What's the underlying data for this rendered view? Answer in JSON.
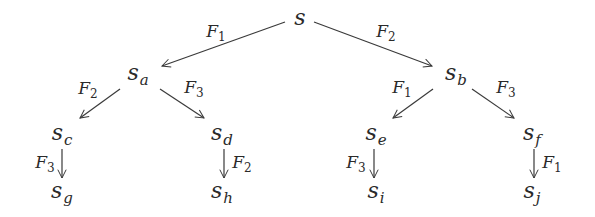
{
  "diagram": {
    "type": "tree",
    "nodes": [
      {
        "id": "s",
        "base": "s",
        "sub": "",
        "x": 300,
        "y": 18
      },
      {
        "id": "sa",
        "base": "s",
        "sub": "a",
        "x": 138,
        "y": 75
      },
      {
        "id": "sb",
        "base": "s",
        "sub": "b",
        "x": 456,
        "y": 75
      },
      {
        "id": "sc",
        "base": "s",
        "sub": "c",
        "x": 62,
        "y": 135
      },
      {
        "id": "sd",
        "base": "s",
        "sub": "d",
        "x": 222,
        "y": 135
      },
      {
        "id": "se",
        "base": "s",
        "sub": "e",
        "x": 376,
        "y": 135
      },
      {
        "id": "sf",
        "base": "s",
        "sub": "f",
        "x": 532,
        "y": 135
      },
      {
        "id": "sg",
        "base": "s",
        "sub": "g",
        "x": 62,
        "y": 193
      },
      {
        "id": "sh",
        "base": "s",
        "sub": "h",
        "x": 222,
        "y": 193
      },
      {
        "id": "si",
        "base": "s",
        "sub": "i",
        "x": 376,
        "y": 193
      },
      {
        "id": "sj",
        "base": "s",
        "sub": "j",
        "x": 532,
        "y": 193
      }
    ],
    "edges": [
      {
        "from": "s",
        "to": "sa",
        "label": "F",
        "label_sub": "1",
        "x1": 285,
        "y1": 22,
        "x2": 162,
        "y2": 66,
        "lx": 216,
        "ly": 33
      },
      {
        "from": "s",
        "to": "sb",
        "label": "F",
        "label_sub": "2",
        "x1": 314,
        "y1": 22,
        "x2": 432,
        "y2": 66,
        "lx": 386,
        "ly": 33
      },
      {
        "from": "sa",
        "to": "sc",
        "label": "F",
        "label_sub": "2",
        "x1": 120,
        "y1": 89,
        "x2": 80,
        "y2": 118,
        "lx": 88,
        "ly": 90
      },
      {
        "from": "sa",
        "to": "sd",
        "label": "F",
        "label_sub": "3",
        "x1": 160,
        "y1": 89,
        "x2": 204,
        "y2": 118,
        "lx": 194,
        "ly": 89
      },
      {
        "from": "sb",
        "to": "se",
        "label": "F",
        "label_sub": "1",
        "x1": 433,
        "y1": 89,
        "x2": 393,
        "y2": 118,
        "lx": 402,
        "ly": 89
      },
      {
        "from": "sb",
        "to": "sf",
        "label": "F",
        "label_sub": "3",
        "x1": 472,
        "y1": 89,
        "x2": 514,
        "y2": 118,
        "lx": 506,
        "ly": 89
      },
      {
        "from": "sc",
        "to": "sg",
        "label": "F",
        "label_sub": "3",
        "x1": 62,
        "y1": 149,
        "x2": 62,
        "y2": 178,
        "lx": 45,
        "ly": 164
      },
      {
        "from": "sd",
        "to": "sh",
        "label": "F",
        "label_sub": "2",
        "x1": 224,
        "y1": 149,
        "x2": 224,
        "y2": 178,
        "lx": 242,
        "ly": 164
      },
      {
        "from": "se",
        "to": "si",
        "label": "F",
        "label_sub": "3",
        "x1": 374,
        "y1": 149,
        "x2": 374,
        "y2": 178,
        "lx": 356,
        "ly": 164
      },
      {
        "from": "sf",
        "to": "sj",
        "label": "F",
        "label_sub": "1",
        "x1": 534,
        "y1": 149,
        "x2": 534,
        "y2": 178,
        "lx": 552,
        "ly": 164
      }
    ],
    "colors": {
      "ink": "#2a2a2a",
      "edge": "#3a3a3a",
      "background": "#ffffff"
    }
  },
  "labels": {
    "s": "s",
    "sa": "a",
    "sb": "b",
    "sc": "c",
    "sd": "d",
    "se": "e",
    "sf": "f",
    "sg": "g",
    "sh": "h",
    "si": "i",
    "sj": "j"
  }
}
